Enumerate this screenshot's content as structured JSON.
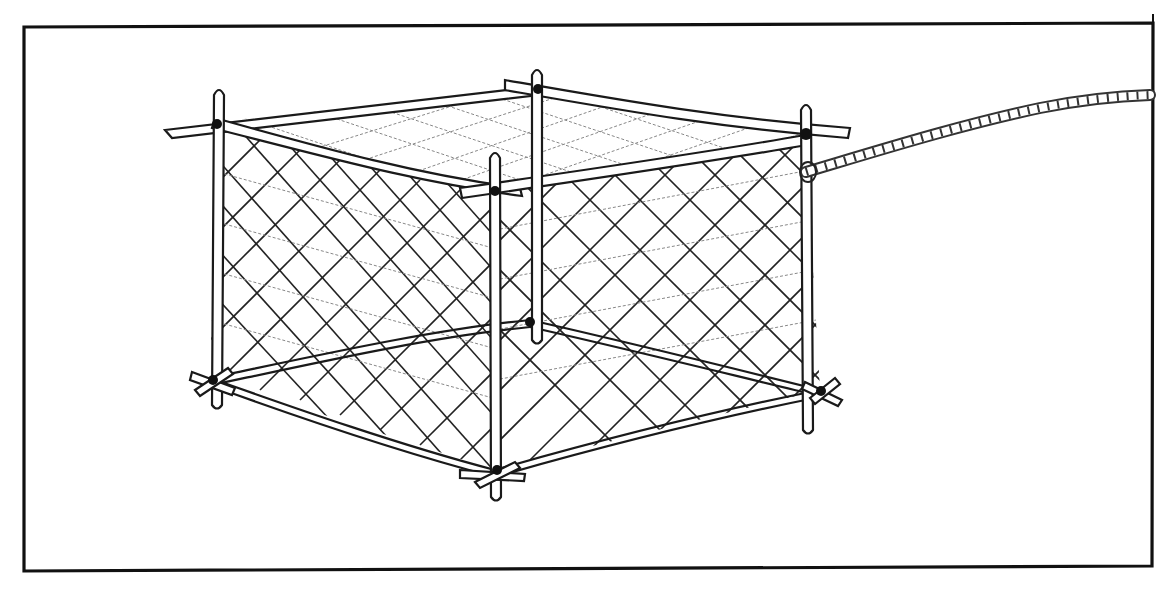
{
  "illustration": {
    "subject": "square lift net trap",
    "style": "hand-drawn pencil sketch",
    "ink_color": "#1a1a1a",
    "background_color": "#ffffff",
    "frame": {
      "x": 22,
      "y": 25,
      "width": 1131,
      "height": 545
    },
    "parts": {
      "corner_posts": 4,
      "net_mesh": "diamond mesh on sides, light mesh on top",
      "rope": "twisted rope attached to right post"
    }
  }
}
